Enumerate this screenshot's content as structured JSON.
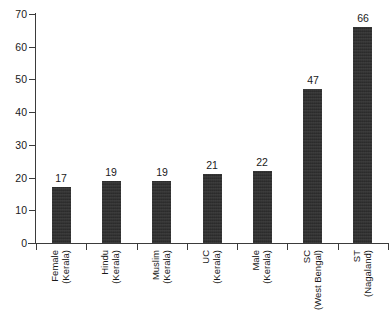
{
  "chart_data": {
    "type": "bar",
    "title": "",
    "subtitle": "",
    "xlabel": "",
    "ylabel": "",
    "ylim": [
      0,
      70
    ],
    "yticks": [
      0,
      10,
      20,
      30,
      40,
      50,
      60,
      70
    ],
    "grid": false,
    "legend": "none",
    "orientation": "vertical",
    "bar_color": "#2b2b2b",
    "background_color": "#ffffff",
    "axis_color": "#3b3b3b",
    "categories": [
      "Female (Kerala)",
      "Hindu (Kerala)",
      "Muslim (Kerala)",
      "UC (Kerala)",
      "Male (Kerala)",
      "SC (West Bengal)",
      "ST (Nagaland)"
    ],
    "category_lines": [
      {
        "group": "Female",
        "region": "(Kerala)"
      },
      {
        "group": "Hindu",
        "region": "(Kerala)"
      },
      {
        "group": "Muslim",
        "region": "(Kerala)"
      },
      {
        "group": "UC",
        "region": "(Kerala)"
      },
      {
        "group": "Male",
        "region": "(Kerala)"
      },
      {
        "group": "SC",
        "region": "(West Bengal)"
      },
      {
        "group": "ST",
        "region": "(Nagaland)"
      }
    ],
    "values": [
      17,
      19,
      19,
      21,
      22,
      47,
      66
    ],
    "value_labels": [
      "17",
      "19",
      "19",
      "21",
      "22",
      "47",
      "66"
    ],
    "ytick_labels": [
      "0",
      "10",
      "20",
      "30",
      "40",
      "50",
      "60",
      "70"
    ]
  }
}
